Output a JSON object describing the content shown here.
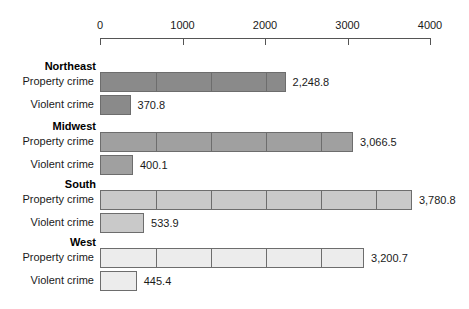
{
  "chart_data": {
    "type": "bar",
    "title": "",
    "subtitle": "",
    "xlabel": "",
    "ylabel": "",
    "orientation": "horizontal",
    "grid": false,
    "legend": "none",
    "xlim": [
      0,
      4000
    ],
    "xticks": [
      0,
      1000,
      2000,
      3000,
      4000
    ],
    "xtick_labels": [
      "0",
      "1000",
      "2000",
      "3000",
      "4000"
    ],
    "segment_interval": 667,
    "series": [
      {
        "name": "Property crime",
        "values": [
          2248.8,
          3066.5,
          3780.8,
          3200.7
        ]
      },
      {
        "name": "Violent crime",
        "values": [
          370.8,
          400.1,
          533.9,
          445.4
        ]
      }
    ],
    "categories": [
      "Northeast",
      "Midwest",
      "South",
      "West"
    ],
    "groups": [
      {
        "title": "Northeast",
        "color": "#8a8a8a",
        "rows": [
          {
            "label": "Property crime",
            "value": 2248.8,
            "value_label": "2,248.8"
          },
          {
            "label": "Violent crime",
            "value": 370.8,
            "value_label": "370.8"
          }
        ]
      },
      {
        "title": "Midwest",
        "color": "#a0a0a0",
        "rows": [
          {
            "label": "Property crime",
            "value": 3066.5,
            "value_label": "3,066.5"
          },
          {
            "label": "Violent crime",
            "value": 400.1,
            "value_label": "400.1"
          }
        ]
      },
      {
        "title": "South",
        "color": "#c9c9c9",
        "rows": [
          {
            "label": "Property crime",
            "value": 3780.8,
            "value_label": "3,780.8"
          },
          {
            "label": "Violent crime",
            "value": 533.9,
            "value_label": "533.9"
          }
        ]
      },
      {
        "title": "West",
        "color": "#ececec",
        "rows": [
          {
            "label": "Property crime",
            "value": 3200.7,
            "value_label": "3,200.7"
          },
          {
            "label": "Violent crime",
            "value": 445.4,
            "value_label": "445.4"
          }
        ]
      }
    ]
  }
}
